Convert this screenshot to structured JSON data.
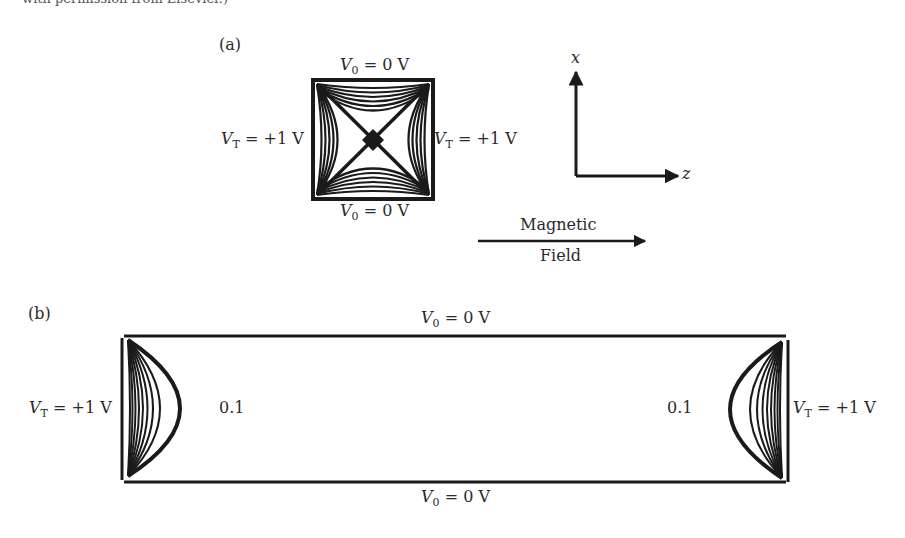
{
  "caption_fragment": "with permission from Elsevier.)",
  "panel_a": {
    "label": "(a)",
    "top_electrode": {
      "symbol": "V",
      "sub": "0",
      "value": " = 0 V"
    },
    "bottom_electrode": {
      "symbol": "V",
      "sub": "0",
      "value": " = 0 V"
    },
    "left_electrode": {
      "symbol": "V",
      "sub": "T",
      "value": " = +1 V"
    },
    "right_electrode": {
      "symbol": "V",
      "sub": "T",
      "value": " = +1 V"
    },
    "axes": {
      "vertical": "x",
      "horizontal": "z"
    },
    "field_arrow": {
      "line1": "Magnetic",
      "line2": "Field"
    }
  },
  "panel_b": {
    "label": "(b)",
    "top_electrode": {
      "symbol": "V",
      "sub": "0",
      "value": " = 0 V"
    },
    "bottom_electrode": {
      "symbol": "V",
      "sub": "0",
      "value": " = 0 V"
    },
    "left_electrode": {
      "symbol": "V",
      "sub": "T",
      "value": " = +1 V"
    },
    "right_electrode": {
      "symbol": "V",
      "sub": "T",
      "value": " = +1 V"
    },
    "left_contour_label": "0.1",
    "right_contour_label": "0.1"
  },
  "colors": {
    "ink": "#1a1a1a",
    "text": "#2a2a2a",
    "background": "#ffffff"
  }
}
